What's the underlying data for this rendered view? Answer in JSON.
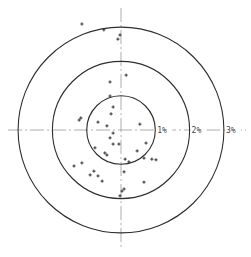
{
  "chart_data": {
    "type": "scatter",
    "subtype": "polar-target",
    "title": "",
    "xlabel": "",
    "ylabel": "",
    "units": "%",
    "center_px": [
      121,
      130
    ],
    "px_per_unit": 34.3,
    "axis_extent_px": {
      "x": [
        8,
        246
      ],
      "y": [
        8,
        250
      ]
    },
    "rings": [
      {
        "label": "1%",
        "value": 1
      },
      {
        "label": "2%",
        "value": 2
      },
      {
        "label": "3%",
        "value": 3
      }
    ],
    "grid": false,
    "legend": null,
    "points": [
      {
        "x": -1.14,
        "y": 3.09
      },
      {
        "x": -0.5,
        "y": 2.92
      },
      {
        "x": -0.03,
        "y": 2.77
      },
      {
        "x": -0.09,
        "y": 2.65
      },
      {
        "x": 0.15,
        "y": 1.6
      },
      {
        "x": -0.32,
        "y": 1.4
      },
      {
        "x": -0.32,
        "y": 0.99
      },
      {
        "x": -0.23,
        "y": 0.67
      },
      {
        "x": -0.29,
        "y": 0.47
      },
      {
        "x": -1.22,
        "y": 0.29
      },
      {
        "x": -1.17,
        "y": 0.35
      },
      {
        "x": -0.67,
        "y": 0.23
      },
      {
        "x": -0.41,
        "y": 0.12
      },
      {
        "x": 0.55,
        "y": 0.17
      },
      {
        "x": -0.23,
        "y": -0.09
      },
      {
        "x": -0.32,
        "y": -0.23
      },
      {
        "x": -0.23,
        "y": -0.41
      },
      {
        "x": -0.06,
        "y": -0.41
      },
      {
        "x": 0.73,
        "y": -0.38
      },
      {
        "x": -0.76,
        "y": -0.52
      },
      {
        "x": -0.47,
        "y": -0.67
      },
      {
        "x": -0.41,
        "y": -0.73
      },
      {
        "x": 0.47,
        "y": -0.61
      },
      {
        "x": 0.67,
        "y": -0.82
      },
      {
        "x": 0.9,
        "y": -0.85
      },
      {
        "x": 1.02,
        "y": -0.87
      },
      {
        "x": 0.12,
        "y": -0.85
      },
      {
        "x": 0.23,
        "y": -0.93
      },
      {
        "x": -1.37,
        "y": -1.05
      },
      {
        "x": -1.14,
        "y": -0.96
      },
      {
        "x": -0.79,
        "y": -1.2
      },
      {
        "x": -0.9,
        "y": -1.31
      },
      {
        "x": -0.67,
        "y": -1.34
      },
      {
        "x": -0.55,
        "y": -1.49
      },
      {
        "x": 0.09,
        "y": -1.22
      },
      {
        "x": 0.67,
        "y": -1.52
      },
      {
        "x": 0.09,
        "y": -1.72
      },
      {
        "x": 0.03,
        "y": -1.78
      },
      {
        "x": -0.03,
        "y": -1.92
      }
    ]
  }
}
